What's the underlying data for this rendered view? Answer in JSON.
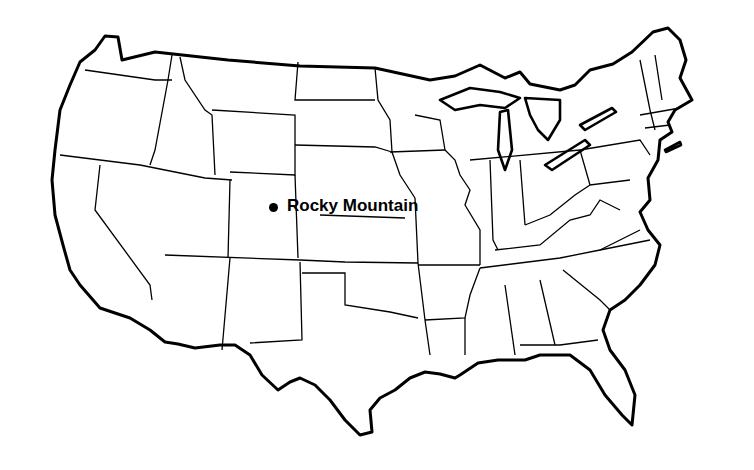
{
  "map": {
    "title": "",
    "region": "Contiguous United States",
    "style": "black outline on white",
    "colors": {
      "line": "#000000",
      "background": "#ffffff"
    },
    "markers": [
      {
        "label": "Rocky Mountain",
        "symbol": "filled-circle",
        "x": 274,
        "y": 208
      }
    ]
  }
}
